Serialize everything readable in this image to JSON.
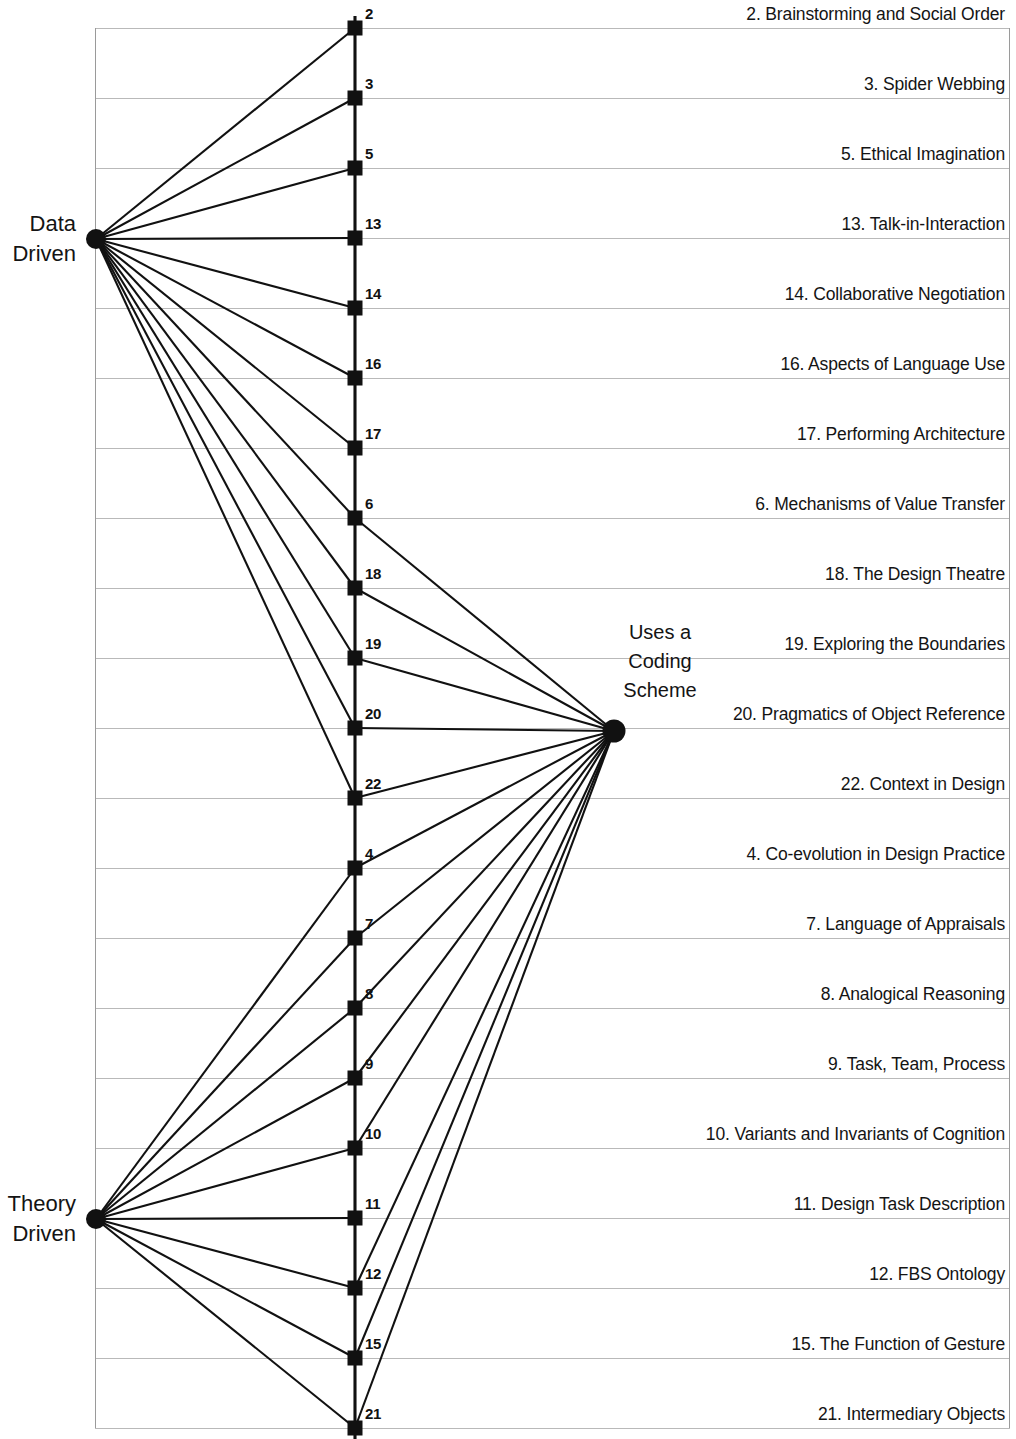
{
  "figure": {
    "type": "bipartite-node-link-diagram",
    "background": "#ffffff",
    "ink_color": "#111111",
    "gridline_color": "#b9b9b9"
  },
  "hubs": {
    "data_driven": {
      "name": "data-driven-hub",
      "label_line1": "Data",
      "label_line2": "Driven",
      "x": 96,
      "y": 239
    },
    "theory_driven": {
      "name": "theory-driven-hub",
      "label_line1": "Theory",
      "label_line2": "Driven",
      "x": 96,
      "y": 1219
    },
    "coding_scheme": {
      "name": "coding-scheme-hub",
      "label_line1": "Uses a",
      "label_line2": "Coding",
      "label_line3": "Scheme",
      "x": 614,
      "y": 731
    }
  },
  "axis": {
    "x": 355,
    "top": 16,
    "bottom": 1439
  },
  "table": {
    "left": 95,
    "right": 1010,
    "top": 28,
    "bottom": 1428,
    "row_height": 70
  },
  "rows": [
    {
      "num": "2",
      "label": "2. Brainstorming and Social Order",
      "y": 28,
      "links": [
        "data_driven"
      ]
    },
    {
      "num": "3",
      "label": "3. Spider Webbing",
      "y": 98,
      "links": [
        "data_driven"
      ]
    },
    {
      "num": "5",
      "label": "5. Ethical Imagination",
      "y": 168,
      "links": [
        "data_driven"
      ]
    },
    {
      "num": "13",
      "label": "13. Talk-in-Interaction",
      "y": 238,
      "links": [
        "data_driven"
      ]
    },
    {
      "num": "14",
      "label": "14. Collaborative Negotiation",
      "y": 308,
      "links": [
        "data_driven"
      ]
    },
    {
      "num": "16",
      "label": "16. Aspects of Language Use",
      "y": 378,
      "links": [
        "data_driven"
      ]
    },
    {
      "num": "17",
      "label": "17. Performing Architecture",
      "y": 448,
      "links": [
        "data_driven"
      ]
    },
    {
      "num": "6",
      "label": "6. Mechanisms of Value Transfer",
      "y": 518,
      "links": [
        "data_driven",
        "coding_scheme"
      ]
    },
    {
      "num": "18",
      "label": "18. The Design Theatre",
      "y": 588,
      "links": [
        "data_driven",
        "coding_scheme"
      ]
    },
    {
      "num": "19",
      "label": "19. Exploring the Boundaries",
      "y": 658,
      "links": [
        "data_driven",
        "coding_scheme"
      ]
    },
    {
      "num": "20",
      "label": "20. Pragmatics of Object Reference",
      "y": 728,
      "links": [
        "data_driven",
        "coding_scheme"
      ]
    },
    {
      "num": "22",
      "label": "22. Context in Design",
      "y": 798,
      "links": [
        "data_driven",
        "coding_scheme"
      ]
    },
    {
      "num": "4",
      "label": "4. Co-evolution in Design Practice",
      "y": 868,
      "links": [
        "theory_driven",
        "coding_scheme"
      ]
    },
    {
      "num": "7",
      "label": "7. Language of Appraisals",
      "y": 938,
      "links": [
        "theory_driven",
        "coding_scheme"
      ]
    },
    {
      "num": "8",
      "label": "8. Analogical Reasoning",
      "y": 1008,
      "links": [
        "theory_driven",
        "coding_scheme"
      ]
    },
    {
      "num": "9",
      "label": "9. Task, Team, Process",
      "y": 1078,
      "links": [
        "theory_driven",
        "coding_scheme"
      ]
    },
    {
      "num": "10",
      "label": "10. Variants and Invariants of Cognition",
      "y": 1148,
      "links": [
        "theory_driven",
        "coding_scheme"
      ]
    },
    {
      "num": "11",
      "label": "11. Design Task Description",
      "y": 1218,
      "links": [
        "theory_driven"
      ]
    },
    {
      "num": "12",
      "label": "12. FBS Ontology",
      "y": 1288,
      "links": [
        "theory_driven",
        "coding_scheme"
      ]
    },
    {
      "num": "15",
      "label": "15. The Function of Gesture",
      "y": 1358,
      "links": [
        "theory_driven",
        "coding_scheme"
      ]
    },
    {
      "num": "21",
      "label": "21. Intermediary Objects",
      "y": 1428,
      "links": [
        "theory_driven",
        "coding_scheme"
      ]
    }
  ],
  "chart_data": {
    "type": "table",
    "title": "",
    "categories": [
      "2. Brainstorming and Social Order",
      "3. Spider Webbing",
      "5. Ethical Imagination",
      "13. Talk-in-Interaction",
      "14. Collaborative Negotiation",
      "16. Aspects of Language Use",
      "17. Performing Architecture",
      "6. Mechanisms of Value Transfer",
      "18. The Design Theatre",
      "19. Exploring the Boundaries",
      "20. Pragmatics of Object Reference",
      "22. Context in Design",
      "4. Co-evolution in Design Practice",
      "7. Language of Appraisals",
      "8. Analogical Reasoning",
      "9. Task, Team, Process",
      "10. Variants and Invariants of Cognition",
      "11. Design Task Description",
      "12. FBS Ontology",
      "15. The Function of Gesture",
      "21. Intermediary Objects"
    ],
    "series": [
      {
        "name": "Data Driven",
        "values": [
          1,
          1,
          1,
          1,
          1,
          1,
          1,
          1,
          1,
          1,
          1,
          1,
          0,
          0,
          0,
          0,
          0,
          0,
          0,
          0,
          0
        ]
      },
      {
        "name": "Theory Driven",
        "values": [
          0,
          0,
          0,
          0,
          0,
          0,
          0,
          0,
          0,
          0,
          0,
          0,
          1,
          1,
          1,
          1,
          1,
          1,
          1,
          1,
          1
        ]
      },
      {
        "name": "Uses a Coding Scheme",
        "values": [
          0,
          0,
          0,
          0,
          0,
          0,
          0,
          1,
          1,
          1,
          1,
          1,
          1,
          1,
          1,
          1,
          1,
          0,
          1,
          1,
          1
        ]
      }
    ],
    "legend_position": "inline-labels",
    "grid": true
  }
}
